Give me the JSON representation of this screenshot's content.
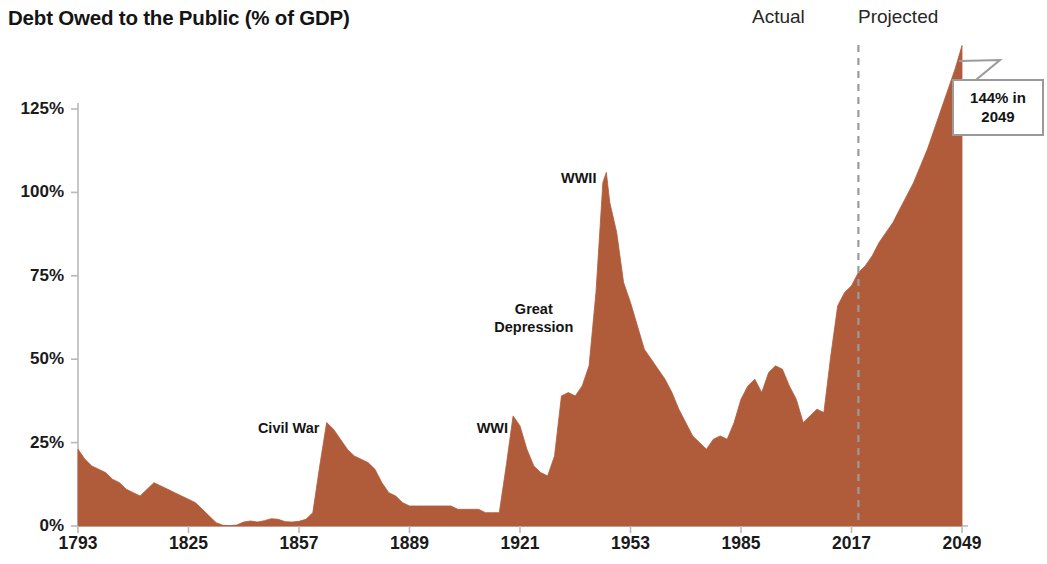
{
  "chart_data": {
    "type": "area",
    "title": "Debt Owed to the Public (% of GDP)",
    "xlabel": "",
    "ylabel": "",
    "xlim": [
      1793,
      2049
    ],
    "ylim": [
      0,
      144
    ],
    "y_axis_max_gridline": 125,
    "grid": false,
    "legend_position": "top-right",
    "fill_color": "#b05c3b",
    "axis_color": "#b9b9b9",
    "divider_color": "#9b9b9b",
    "x_tick_labels": [
      "1793",
      "1825",
      "1857",
      "1889",
      "1921",
      "1953",
      "1985",
      "2017",
      "2049"
    ],
    "x_tick_values": [
      1793,
      1825,
      1857,
      1889,
      1921,
      1953,
      1985,
      2017,
      2049
    ],
    "y_tick_labels": [
      "0%",
      "25%",
      "50%",
      "75%",
      "100%",
      "125%"
    ],
    "y_tick_values": [
      0,
      25,
      50,
      75,
      100,
      125
    ],
    "actual_projected_divider_year": 2019,
    "series": [
      {
        "name": "Debt Owed to the Public (% of GDP)",
        "x": [
          1793,
          1795,
          1797,
          1799,
          1801,
          1803,
          1805,
          1807,
          1809,
          1811,
          1813,
          1815,
          1817,
          1819,
          1821,
          1823,
          1825,
          1827,
          1829,
          1831,
          1833,
          1835,
          1837,
          1839,
          1841,
          1843,
          1845,
          1847,
          1849,
          1851,
          1853,
          1855,
          1857,
          1859,
          1861,
          1863,
          1865,
          1867,
          1869,
          1871,
          1873,
          1875,
          1877,
          1879,
          1881,
          1883,
          1885,
          1887,
          1889,
          1891,
          1893,
          1895,
          1897,
          1899,
          1901,
          1903,
          1905,
          1907,
          1909,
          1911,
          1913,
          1915,
          1917,
          1919,
          1921,
          1923,
          1925,
          1927,
          1929,
          1931,
          1933,
          1935,
          1937,
          1939,
          1941,
          1943,
          1945,
          1946,
          1947,
          1949,
          1951,
          1953,
          1955,
          1957,
          1959,
          1961,
          1963,
          1965,
          1967,
          1969,
          1971,
          1973,
          1975,
          1977,
          1979,
          1981,
          1983,
          1985,
          1987,
          1989,
          1991,
          1993,
          1995,
          1997,
          1999,
          2001,
          2003,
          2005,
          2007,
          2009,
          2011,
          2013,
          2015,
          2017,
          2019,
          2021,
          2023,
          2025,
          2027,
          2029,
          2031,
          2033,
          2035,
          2037,
          2039,
          2041,
          2043,
          2045,
          2047,
          2049
        ],
        "y": [
          23,
          20,
          18,
          17,
          16,
          14,
          13,
          11,
          10,
          9,
          11,
          13,
          12,
          11,
          10,
          9,
          8,
          7,
          5,
          3,
          1,
          0.2,
          0.1,
          0.3,
          1.2,
          1.5,
          1.2,
          1.6,
          2.2,
          2.0,
          1.3,
          1.2,
          1.4,
          2.0,
          4,
          18,
          31,
          29,
          26,
          23,
          21,
          20,
          19,
          17,
          13,
          10,
          9,
          7,
          6,
          6,
          6,
          6,
          6,
          6,
          6,
          5,
          5,
          5,
          5,
          4,
          4,
          4,
          18,
          33,
          30,
          23,
          18,
          16,
          15,
          21,
          39,
          40,
          39,
          42,
          48,
          70,
          103,
          106,
          97,
          88,
          73,
          67,
          60,
          53,
          50,
          47,
          44,
          40,
          35,
          31,
          27,
          25,
          23,
          26,
          27,
          26,
          31,
          38,
          42,
          44,
          40,
          46,
          48,
          47,
          42,
          38,
          31,
          33,
          35,
          34,
          51,
          66,
          70,
          72,
          76,
          78,
          81,
          85,
          88,
          91,
          95,
          99,
          103,
          108,
          113,
          119,
          125,
          131,
          137,
          144
        ]
      }
    ],
    "annotations": [
      {
        "text": "Civil War",
        "x": 1854,
        "y": 29,
        "anchor": "center"
      },
      {
        "text": "WWI",
        "x": 1913,
        "y": 29,
        "anchor": "center"
      },
      {
        "text": "Great\nDepression",
        "x": 1925,
        "y": 62,
        "anchor": "center"
      },
      {
        "text": "WWII",
        "x": 1938,
        "y": 104,
        "anchor": "center"
      }
    ],
    "callout": {
      "text": "144% in\n2049",
      "value": 144,
      "year": 2049
    },
    "period_labels": [
      {
        "text": "Actual",
        "side": "left"
      },
      {
        "text": "Projected",
        "side": "right"
      }
    ]
  }
}
